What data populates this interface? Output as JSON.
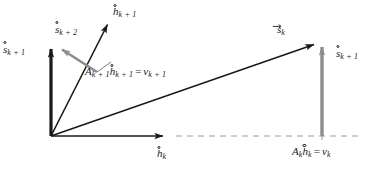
{
  "figure": {
    "background": "#ffffff",
    "width": 376,
    "height": 172,
    "colors": {
      "black": "#1a1a1a",
      "gray": "#8c8c8c",
      "dashed": "#9a9a9a"
    },
    "origin": {
      "x": 51,
      "y": 136
    }
  },
  "labels": {
    "s_k_plus_1_left": {
      "base": "s",
      "sub": "k + 1",
      "accent": "ring",
      "x": 3,
      "y": 44
    },
    "s_k_plus_2": {
      "base": "s",
      "sub": "k + 2",
      "accent": "ring",
      "x": 55,
      "y": 24
    },
    "h_k_plus_1": {
      "base": "h",
      "sub": "k + 1",
      "accent": "ring",
      "x": 113,
      "y": 6
    },
    "s_k_vec": {
      "base": "s",
      "sub": "k",
      "accent": "arrow",
      "x": 277,
      "y": 24
    },
    "s_k_plus_1_right": {
      "base": "s",
      "sub": "k + 1",
      "accent": "ring",
      "x": 336,
      "y": 48
    },
    "h_k": {
      "base": "h",
      "sub": "k",
      "accent": "ring",
      "x": 157,
      "y": 148
    },
    "equation_top": {
      "A": "A",
      "A_sub": "k + 1",
      "h": "h",
      "h_sub": "k + 1",
      "equals": "=",
      "v": "v",
      "v_sub": "k + 1",
      "x": 85,
      "y": 66
    },
    "equation_bottom": {
      "A": "A",
      "A_sub": "k",
      "h": "h",
      "h_sub": "k",
      "equals": "=",
      "v": "v",
      "v_sub": "k",
      "x": 292,
      "y": 146
    }
  },
  "vectors": [
    {
      "name": "s-k-plus-1-left-vector",
      "color": "#1a1a1a",
      "from": [
        51,
        136
      ],
      "to": [
        51,
        43
      ]
    },
    {
      "name": "h-k-plus-1-vector",
      "color": "#1a1a1a",
      "from": [
        51,
        136
      ],
      "to": [
        110,
        18
      ]
    },
    {
      "name": "s-k-plus-2-vector",
      "color": "#8c8c8c",
      "from": [
        97,
        72
      ],
      "to": [
        58,
        47
      ]
    },
    {
      "name": "s-k-vector",
      "color": "#1a1a1a",
      "from": [
        51,
        136
      ],
      "to": [
        318,
        43
      ]
    },
    {
      "name": "h-k-vector",
      "color": "#1a1a1a",
      "from": [
        51,
        136
      ],
      "to": [
        168,
        136
      ]
    },
    {
      "name": "s-k-plus-1-right-vector",
      "color": "#8c8c8c",
      "from": [
        322,
        136
      ],
      "to": [
        322,
        42
      ]
    }
  ],
  "dashed_line": {
    "name": "baseline-dashed",
    "from": [
      176,
      136
    ],
    "to": [
      363,
      136
    ],
    "color": "#9a9a9a"
  },
  "leader_line": {
    "name": "equation-leader-line",
    "from": [
      110,
      60
    ],
    "to": [
      97,
      72
    ],
    "color": "#6e6e6e"
  },
  "tick": {
    "name": "projection-tick",
    "x": 322,
    "y_top": 128,
    "y_bottom": 140
  }
}
